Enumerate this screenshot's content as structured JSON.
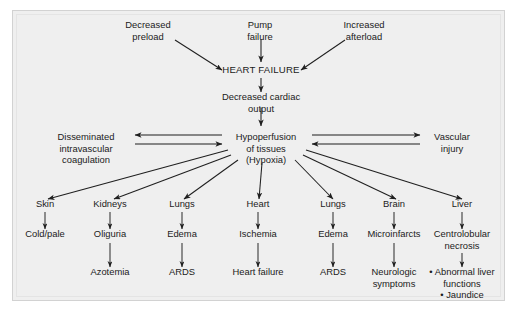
{
  "figure": {
    "type": "flowchart",
    "frame_bg": "#efefef",
    "page_bg": "#ffffff",
    "line_color": "#1f1f1f",
    "text_color": "#1b1b1b"
  },
  "nodes": {
    "decreased_preload": {
      "lines": [
        "Decreased",
        "preload"
      ],
      "x": 148,
      "y": 28
    },
    "pump_failure": {
      "lines": [
        "Pump",
        "failure"
      ],
      "x": 260,
      "y": 28
    },
    "increased_afterload": {
      "lines": [
        "Increased",
        "afterload"
      ],
      "x": 364,
      "y": 28
    },
    "heart_failure": {
      "lines": [
        "HEART FAILURE"
      ],
      "x": 261,
      "y": 73
    },
    "decreased_cardiac_output": {
      "lines": [
        "Decreased cardiac",
        "output"
      ],
      "x": 261,
      "y": 100
    },
    "dic": {
      "lines": [
        "Disseminated",
        "intravascular",
        "coagulation"
      ],
      "x": 86,
      "y": 140
    },
    "hypoperfusion": {
      "lines": [
        "Hypoperfusion",
        "of tissues",
        "(Hypoxia)"
      ],
      "x": 266,
      "y": 140
    },
    "vascular_injury": {
      "lines": [
        "Vascular",
        "injury"
      ],
      "x": 452,
      "y": 140
    }
  },
  "organ_columns": [
    {
      "organ": "Skin",
      "x": 45,
      "level2": "Cold/pale",
      "level3": null
    },
    {
      "organ": "Kidneys",
      "x": 110,
      "level2": "Oliguria",
      "level3": "Azotemia"
    },
    {
      "organ": "Lungs",
      "x": 182,
      "level2": "Edema",
      "level3": "ARDS"
    },
    {
      "organ": "Heart",
      "x": 258,
      "level2": "Ischemia",
      "level3": "Heart failure"
    },
    {
      "organ": "Lungs",
      "x": 333,
      "level2": "Edema",
      "level3": "ARDS"
    },
    {
      "organ": "Brain",
      "x": 394,
      "level2": "Microinfarcts",
      "level3_lines": [
        "Neurologic",
        "symptoms"
      ]
    },
    {
      "organ": "Liver",
      "x": 462,
      "level2_lines": [
        "Centrolobular",
        "necrosis"
      ],
      "level3_bullets": [
        "• Abnormal liver",
        "functions",
        "• Jaundice"
      ]
    }
  ],
  "rows": {
    "organ_y": 207,
    "level2_y": 237,
    "level3_y": 275
  },
  "edges": [
    {
      "name": "preload-to-heart-failure",
      "from": [
        175,
        40
      ],
      "to": [
        222,
        70
      ]
    },
    {
      "name": "pump-failure-to-heart-failure",
      "from": [
        261,
        39
      ],
      "to": [
        261,
        62
      ]
    },
    {
      "name": "afterload-to-heart-failure",
      "from": [
        345,
        40
      ],
      "to": [
        301,
        70
      ]
    },
    {
      "name": "heart-failure-to-output",
      "from": [
        261,
        78
      ],
      "to": [
        261,
        92
      ]
    },
    {
      "name": "output-to-hypoperfusion",
      "from": [
        261,
        108
      ],
      "to": [
        261,
        126
      ]
    },
    {
      "name": "hypoperfusion-to-dic",
      "from": [
        222,
        135
      ],
      "to": [
        135,
        135
      ]
    },
    {
      "name": "dic-to-hypoperfusion",
      "from": [
        135,
        144
      ],
      "to": [
        222,
        144
      ]
    },
    {
      "name": "hypoperfusion-to-vascular",
      "from": [
        312,
        135
      ],
      "to": [
        420,
        135
      ]
    },
    {
      "name": "vascular-to-hypoperfusion",
      "from": [
        420,
        144
      ],
      "to": [
        312,
        144
      ]
    },
    {
      "name": "hypoperfusion-to-skin",
      "from": [
        228,
        150
      ],
      "to": [
        48,
        199
      ]
    },
    {
      "name": "hypoperfusion-to-kidneys",
      "from": [
        231,
        155
      ],
      "to": [
        114,
        199
      ]
    },
    {
      "name": "hypoperfusion-to-lungs-l",
      "from": [
        238,
        160
      ],
      "to": [
        184,
        199
      ]
    },
    {
      "name": "hypoperfusion-to-heart",
      "from": [
        262,
        163
      ],
      "to": [
        259,
        199
      ]
    },
    {
      "name": "hypoperfusion-to-lungs-r",
      "from": [
        295,
        160
      ],
      "to": [
        333,
        199
      ]
    },
    {
      "name": "hypoperfusion-to-brain",
      "from": [
        303,
        155
      ],
      "to": [
        396,
        199
      ]
    },
    {
      "name": "hypoperfusion-to-liver",
      "from": [
        306,
        150
      ],
      "to": [
        462,
        199
      ]
    }
  ],
  "column_edges": [
    {
      "name": "skin-to-coldpale",
      "x": 45,
      "from_y": 212,
      "to_y": 229
    },
    {
      "name": "kidneys-to-oliguria",
      "x": 110,
      "from_y": 212,
      "to_y": 229
    },
    {
      "name": "lungs-l-to-edema",
      "x": 182,
      "from_y": 212,
      "to_y": 229
    },
    {
      "name": "heart-to-ischemia",
      "x": 258,
      "from_y": 212,
      "to_y": 229
    },
    {
      "name": "lungs-r-to-edema",
      "x": 333,
      "from_y": 212,
      "to_y": 229
    },
    {
      "name": "brain-to-microinfarcts",
      "x": 394,
      "from_y": 212,
      "to_y": 229
    },
    {
      "name": "liver-to-centrolobular",
      "x": 462,
      "from_y": 212,
      "to_y": 229
    },
    {
      "name": "oliguria-to-azotemia",
      "x": 110,
      "from_y": 243,
      "to_y": 267
    },
    {
      "name": "edema-to-ards-l",
      "x": 182,
      "from_y": 243,
      "to_y": 267
    },
    {
      "name": "ischemia-to-heart-failure",
      "x": 258,
      "from_y": 243,
      "to_y": 267
    },
    {
      "name": "edema-to-ards-r",
      "x": 333,
      "from_y": 243,
      "to_y": 267
    },
    {
      "name": "microinfarcts-to-neuro",
      "x": 394,
      "from_y": 243,
      "to_y": 267
    },
    {
      "name": "necrosis-to-liver-findings",
      "x": 462,
      "from_y": 253,
      "to_y": 267
    }
  ]
}
